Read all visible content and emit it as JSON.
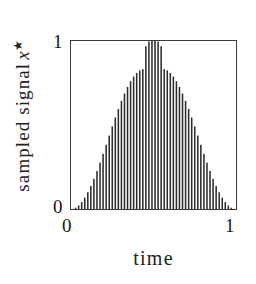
{
  "figure": {
    "background": "#ffffff",
    "ink_color": "#222222",
    "frame_color": "#3a3a3a"
  },
  "axes": {
    "ylabel_text": "sampled signal",
    "ylabel_symbol": "x",
    "ylabel_superscript": "★",
    "xlabel": "time",
    "y_ticks": [
      "0",
      "1"
    ],
    "x_ticks": [
      "0",
      "1"
    ]
  },
  "chart_data": {
    "type": "bar",
    "title": "",
    "xlabel": "time",
    "ylabel": "sampled signal x★",
    "xlim": [
      0,
      1
    ],
    "ylim": [
      0,
      1
    ],
    "x_tick_values": [
      0,
      1
    ],
    "y_tick_values": [
      0,
      1
    ],
    "grid": false,
    "legend": null,
    "bar_color": "#2b2b2b",
    "n_samples": 54,
    "x": [
      0.0093,
      0.0278,
      0.0463,
      0.0648,
      0.0833,
      0.1019,
      0.1204,
      0.1389,
      0.1574,
      0.1759,
      0.1944,
      0.213,
      0.2315,
      0.25,
      0.2685,
      0.287,
      0.3056,
      0.3241,
      0.3426,
      0.3611,
      0.3796,
      0.3981,
      0.4167,
      0.4352,
      0.4537,
      0.4722,
      0.4907,
      0.5093,
      0.5278,
      0.5463,
      0.5648,
      0.5833,
      0.6019,
      0.6204,
      0.6389,
      0.6574,
      0.6759,
      0.6944,
      0.713,
      0.7315,
      0.75,
      0.7685,
      0.787,
      0.8056,
      0.8241,
      0.8426,
      0.8611,
      0.8796,
      0.8981,
      0.9167,
      0.9352,
      0.9537,
      0.9722,
      0.9907
    ],
    "values": [
      0.0009,
      0.0077,
      0.0212,
      0.0412,
      0.0675,
      0.0997,
      0.1373,
      0.1797,
      0.2262,
      0.2761,
      0.3284,
      0.3824,
      0.4371,
      0.4914,
      0.5446,
      0.5955,
      0.6434,
      0.6873,
      0.7265,
      0.7604,
      0.7883,
      0.8098,
      0.8246,
      0.8325,
      0.9686,
      0.9965,
      1.0,
      1.0,
      0.9965,
      0.9686,
      0.8325,
      0.8246,
      0.8098,
      0.7883,
      0.7604,
      0.7265,
      0.6873,
      0.6434,
      0.5955,
      0.5446,
      0.4914,
      0.4371,
      0.3824,
      0.3284,
      0.2761,
      0.2262,
      0.1797,
      0.1373,
      0.0997,
      0.0675,
      0.0412,
      0.0212,
      0.0077,
      0.0009
    ]
  }
}
